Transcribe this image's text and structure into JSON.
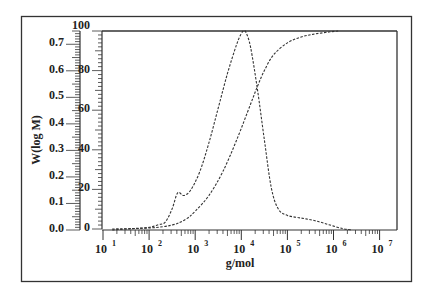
{
  "chart_data": {
    "type": "line",
    "title": "",
    "xlabel": "g/mol",
    "ylabel_left": "W(log M)",
    "ylabel_right": "",
    "xscale": "log",
    "xlim": [
      10,
      10000000
    ],
    "ylim_left": [
      0.0,
      0.75
    ],
    "ylim_right": [
      0,
      100
    ],
    "x_tick_labels": [
      "10^1",
      "10^2",
      "10^3",
      "10^4",
      "10^5",
      "10^6",
      "10^7"
    ],
    "x_tick_exponents": [
      1,
      2,
      3,
      4,
      5,
      6,
      7
    ],
    "y_left_tick_labels": [
      "0.0",
      "0.1",
      "0.2",
      "0.3",
      "0.4",
      "0.5",
      "0.6",
      "0.7"
    ],
    "y_left_ticks": [
      0.0,
      0.1,
      0.2,
      0.3,
      0.4,
      0.5,
      0.6,
      0.7
    ],
    "y_right_tick_labels": [
      "0",
      "20",
      "40",
      "60",
      "80",
      "100"
    ],
    "y_right_ticks": [
      0,
      20,
      40,
      60,
      80,
      100
    ],
    "grid": false,
    "legend": null,
    "series": [
      {
        "name": "Differential distribution W(log M)",
        "axis": "left",
        "style": "dashed",
        "log_x": [
          1.2,
          1.6,
          2.0,
          2.2,
          2.35,
          2.5,
          2.62,
          2.75,
          2.9,
          3.1,
          3.3,
          3.5,
          3.7,
          3.9,
          4.0,
          4.05,
          4.1,
          4.2,
          4.35,
          4.5,
          4.65,
          4.8,
          5.0,
          5.3,
          5.6,
          5.9,
          6.2,
          6.4
        ],
        "values": [
          0.0,
          0.005,
          0.01,
          0.02,
          0.03,
          0.08,
          0.14,
          0.13,
          0.15,
          0.22,
          0.33,
          0.46,
          0.59,
          0.7,
          0.74,
          0.75,
          0.745,
          0.69,
          0.53,
          0.34,
          0.16,
          0.08,
          0.055,
          0.045,
          0.035,
          0.02,
          0.005,
          0.0
        ]
      },
      {
        "name": "Cumulative distribution (%)",
        "axis": "right",
        "style": "dashed",
        "log_x": [
          1.2,
          2.0,
          2.5,
          2.8,
          3.0,
          3.3,
          3.6,
          3.9,
          4.2,
          4.35,
          4.5,
          4.7,
          5.0,
          5.3,
          5.6,
          5.9,
          6.1
        ],
        "values": [
          0,
          0.5,
          2,
          5,
          9,
          17,
          29,
          45,
          63,
          72,
          80,
          88,
          94,
          97,
          98.5,
          99.5,
          100
        ]
      }
    ],
    "annotations": []
  }
}
